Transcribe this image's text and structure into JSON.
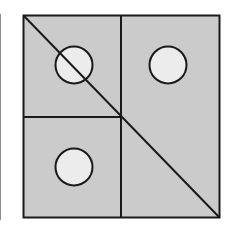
{
  "diagram": {
    "type": "square-partition",
    "colors": {
      "fill": "#cbcbcb",
      "stroke": "#1a1a1a",
      "circle_fill": "#ececec",
      "background": "#ffffff",
      "edge_line": "#8a8a8a"
    },
    "square": {
      "x": 23,
      "y": 15,
      "size": 197
    },
    "center": {
      "x": 121,
      "y": 117
    },
    "diagonal": {
      "from": "top-left",
      "to": "bottom-right"
    },
    "quadrants": [
      {
        "position": "top-left",
        "has_circle": true,
        "circle": {
          "cx": 74,
          "cy": 65,
          "r": 19
        },
        "crossed_by_diagonal": true
      },
      {
        "position": "top-right",
        "has_circle": true,
        "circle": {
          "cx": 168,
          "cy": 65,
          "r": 19
        },
        "crossed_by_diagonal": false
      },
      {
        "position": "bottom-left",
        "has_circle": true,
        "circle": {
          "cx": 74,
          "cy": 167,
          "r": 19
        },
        "crossed_by_diagonal": false
      },
      {
        "position": "bottom-right",
        "has_circle": false,
        "crossed_by_diagonal": true
      }
    ]
  }
}
